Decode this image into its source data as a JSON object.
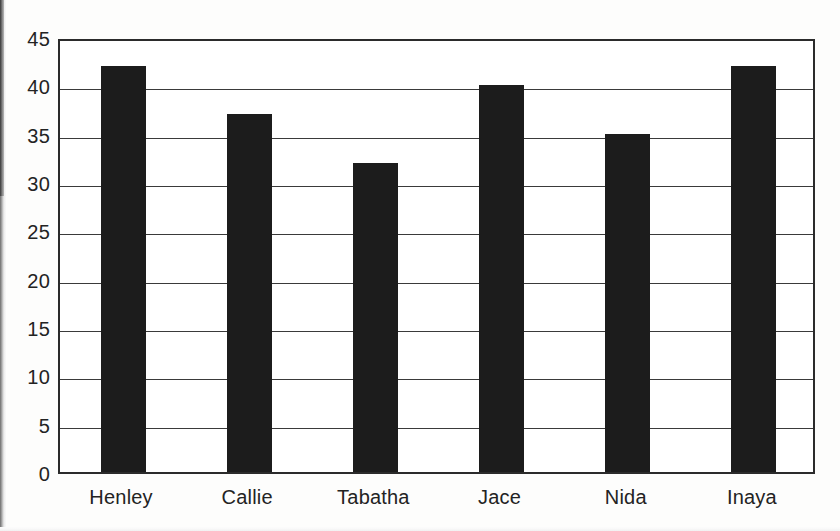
{
  "chart_data": {
    "type": "bar",
    "title": "",
    "subtitle": "",
    "xlabel": "",
    "ylabel": "",
    "categories": [
      "Henley",
      "Callie",
      "Tabatha",
      "Jace",
      "Nida",
      "Inaya"
    ],
    "values": [
      42,
      37,
      32,
      40,
      35,
      42
    ],
    "series": [
      {
        "name": "",
        "values": [
          42,
          37,
          32,
          40,
          35,
          42
        ]
      }
    ],
    "ylim": [
      0,
      45
    ],
    "xlim": [
      0,
      6
    ],
    "y_ticks": [
      0,
      5,
      10,
      15,
      20,
      25,
      30,
      35,
      40,
      45
    ],
    "y_tick_labels": [
      "0",
      "5",
      "10",
      "15",
      "20",
      "25",
      "30",
      "35",
      "40",
      "45"
    ],
    "x_tick_labels": [
      "Henley",
      "Callie",
      "Tabatha",
      "Jace",
      "Nida",
      "Inaya"
    ],
    "grid": "horizontal",
    "legend": "none",
    "bar_color": "#1c1c1c",
    "axis_color": "#2b2b2b",
    "gridline_color": "#3a3a3a",
    "text_color": "#232323",
    "background_color": "#ffffff"
  },
  "figure": {
    "plot_left_px": 58,
    "plot_top_px": 39,
    "plot_width_px": 757,
    "plot_height_px": 435
  }
}
